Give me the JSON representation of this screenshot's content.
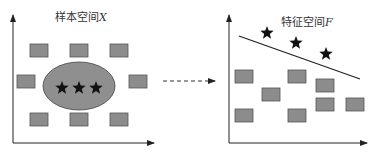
{
  "left_panel": {
    "title_prefix": "样本空间",
    "title_var": "X",
    "squares": [
      {
        "x": 30,
        "y": 44
      },
      {
        "x": 70,
        "y": 44
      },
      {
        "x": 110,
        "y": 44
      },
      {
        "x": 17,
        "y": 75
      },
      {
        "x": 129,
        "y": 75
      },
      {
        "x": 30,
        "y": 113
      },
      {
        "x": 70,
        "y": 113
      },
      {
        "x": 110,
        "y": 113
      }
    ],
    "ellipse": {
      "cx": 79,
      "cy": 86,
      "rx": 36,
      "ry": 24
    },
    "stars": [
      {
        "x": 62,
        "y": 88
      },
      {
        "x": 79,
        "y": 88
      },
      {
        "x": 96,
        "y": 88
      }
    ]
  },
  "right_panel": {
    "title_prefix": "特征空间",
    "title_var": "F",
    "squares": [
      {
        "x": 235,
        "y": 70
      },
      {
        "x": 288,
        "y": 70
      },
      {
        "x": 316,
        "y": 79
      },
      {
        "x": 262,
        "y": 88
      },
      {
        "x": 316,
        "y": 98
      },
      {
        "x": 346,
        "y": 98
      },
      {
        "x": 235,
        "y": 109
      },
      {
        "x": 288,
        "y": 109
      }
    ],
    "line": {
      "x1": 239,
      "y1": 36,
      "x2": 360,
      "y2": 79
    },
    "stars": [
      {
        "x": 267,
        "y": 33
      },
      {
        "x": 296,
        "y": 43
      },
      {
        "x": 326,
        "y": 54
      }
    ]
  },
  "arrow": {
    "x1": 163,
    "x2": 215,
    "y": 81,
    "style": "dashed"
  },
  "colors": {
    "square_fill": "#8c8c8c",
    "square_stroke": "#555555",
    "ellipse_fill": "#8f8f8f",
    "ellipse_stroke": "#444444",
    "star": "#111111",
    "axis": "#222222"
  }
}
